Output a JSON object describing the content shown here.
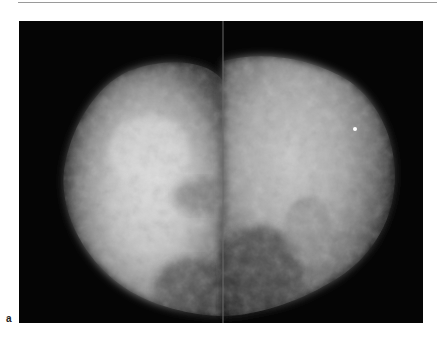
{
  "figure": {
    "panel_label": "a",
    "colors": {
      "background": "#050505",
      "tissue_bright": "#d8d8d8",
      "tissue_mid": "#8a8a8a",
      "tissue_dark": "#3c3c3c",
      "rule": "#9a9a9a"
    }
  }
}
